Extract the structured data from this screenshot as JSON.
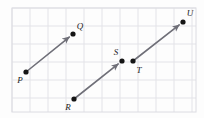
{
  "figure": {
    "width": 204,
    "height": 118,
    "background_color": "#fdfdfd",
    "grid": {
      "visible": true,
      "line_color": "#e3e3e8",
      "border_color": "#dcdce2",
      "spacing": 18,
      "origin_x": 12,
      "origin_y": 8,
      "columns": 10,
      "rows": 6,
      "right_edge": 196,
      "bottom_edge": 112
    },
    "style": {
      "vector_color": "#6f6f78",
      "vector_width": 1.6,
      "dot_color": "#151515",
      "dot_radius": 2.6,
      "label_color": "#1b1b1b",
      "label_font_size": 9
    },
    "points": [
      {
        "id": "P",
        "label": "P",
        "x": 26,
        "y": 72,
        "label_x": 20,
        "label_y": 80,
        "dot": true
      },
      {
        "id": "Q",
        "label": "Q",
        "x": 73,
        "y": 34,
        "label_x": 80,
        "label_y": 26,
        "dot": true
      },
      {
        "id": "R",
        "label": "R",
        "x": 74,
        "y": 99,
        "label_x": 68,
        "label_y": 107,
        "dot": true
      },
      {
        "id": "S",
        "label": "S",
        "x": 122,
        "y": 61,
        "label_x": 116,
        "label_y": 52,
        "dot": true
      },
      {
        "id": "T",
        "label": "T",
        "x": 133,
        "y": 61,
        "label_x": 139,
        "label_y": 70,
        "dot": true
      },
      {
        "id": "U",
        "label": "U",
        "x": 183,
        "y": 22,
        "label_x": 190,
        "label_y": 13,
        "dot": true
      }
    ],
    "vectors": [
      {
        "id": "PQ",
        "name": "vector-pq",
        "from": "P",
        "to": "Q",
        "x1": 26,
        "y1": 72,
        "x2": 73,
        "y2": 34,
        "arrowhead": "end"
      },
      {
        "id": "RS",
        "name": "vector-rs",
        "from": "R",
        "to": "S",
        "x1": 74,
        "y1": 99,
        "x2": 122,
        "y2": 61,
        "arrowhead": "end"
      },
      {
        "id": "TU",
        "name": "vector-tu",
        "from": "T",
        "to": "U",
        "x1": 133,
        "y1": 61,
        "x2": 183,
        "y2": 22,
        "arrowhead": "end"
      }
    ]
  }
}
